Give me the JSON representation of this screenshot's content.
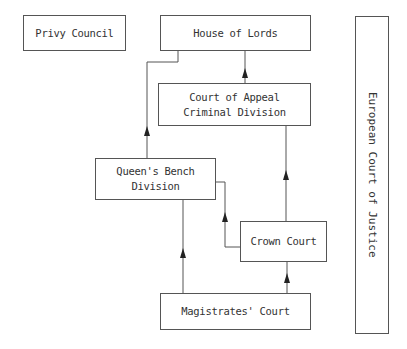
{
  "diagram": {
    "title": "",
    "nodes": {
      "privy_council": {
        "label": "Privy Council"
      },
      "house_of_lords": {
        "label": "House of Lords"
      },
      "court_of_appeal": {
        "line1": "Court of Appeal",
        "line2": "Criminal Division"
      },
      "queens_bench": {
        "line1": "Queen's Bench",
        "line2": "Division"
      },
      "crown_court": {
        "label": "Crown Court"
      },
      "magistrates_court": {
        "label": "Magistrates' Court"
      },
      "european_court": {
        "label": "European Court of Justice"
      }
    },
    "edges": [
      {
        "from": "Magistrates' Court",
        "to": "Queen's Bench Division"
      },
      {
        "from": "Magistrates' Court",
        "to": "Crown Court"
      },
      {
        "from": "Crown Court",
        "to": "Queen's Bench Division"
      },
      {
        "from": "Crown Court",
        "to": "Court of Appeal Criminal Division"
      },
      {
        "from": "Queen's Bench Division",
        "to": "House of Lords"
      },
      {
        "from": "Court of Appeal Criminal Division",
        "to": "House of Lords"
      }
    ],
    "colors": {
      "line": "#555555",
      "background": "#ffffff"
    }
  }
}
